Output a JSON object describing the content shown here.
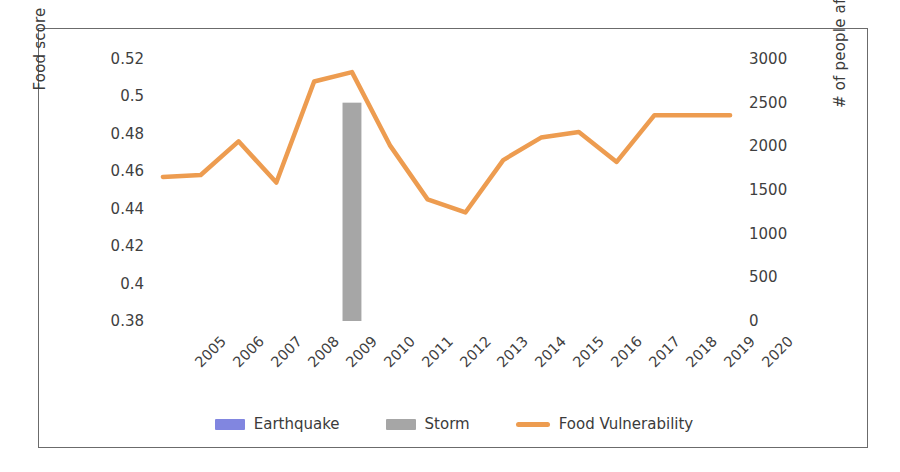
{
  "chart_data": {
    "type": "line",
    "title": "",
    "xlabel": "",
    "ylabel": "Food score",
    "ylabel_secondary": "# of people affected",
    "grid": false,
    "legend_position": "bottom",
    "categories": [
      "2005",
      "2006",
      "2007",
      "2008",
      "2009",
      "2010",
      "2011",
      "2012",
      "2013",
      "2014",
      "2015",
      "2016",
      "2017",
      "2018",
      "2019",
      "2020"
    ],
    "ylim": [
      0.38,
      0.52
    ],
    "yticks": [
      "0.52",
      "0.5",
      "0.48",
      "0.46",
      "0.44",
      "0.42",
      "0.4",
      "0.38"
    ],
    "ylim_secondary": [
      0,
      3000
    ],
    "yticks_secondary": [
      "3000",
      "2500",
      "2000",
      "1500",
      "1000",
      "500",
      "0"
    ],
    "series": [
      {
        "name": "Earthquake",
        "type": "bar",
        "axis": "secondary",
        "color": "#8186e0",
        "values": [
          0,
          0,
          0,
          0,
          0,
          0,
          0,
          0,
          0,
          0,
          0,
          0,
          0,
          0,
          0,
          0
        ]
      },
      {
        "name": "Storm",
        "type": "bar",
        "axis": "secondary",
        "color": "#a6a6a6",
        "values": [
          0,
          0,
          0,
          0,
          0,
          2500,
          0,
          0,
          0,
          0,
          0,
          0,
          0,
          0,
          0,
          0
        ]
      },
      {
        "name": "Food Vulnerability",
        "type": "line",
        "axis": "primary",
        "color": "#ed9c50",
        "values": [
          0.457,
          0.458,
          0.476,
          0.454,
          0.508,
          0.513,
          0.474,
          0.445,
          0.438,
          0.466,
          0.478,
          0.481,
          0.465,
          0.49,
          0.49,
          0.49
        ]
      }
    ]
  },
  "legend": {
    "items": [
      {
        "label": "Earthquake",
        "marker": "bar-swatch",
        "color": "#8186e0"
      },
      {
        "label": "Storm",
        "marker": "bar-swatch",
        "color": "#a6a6a6"
      },
      {
        "label": "Food Vulnerability",
        "marker": "line-swatch",
        "color": "#ed9c50"
      }
    ]
  }
}
